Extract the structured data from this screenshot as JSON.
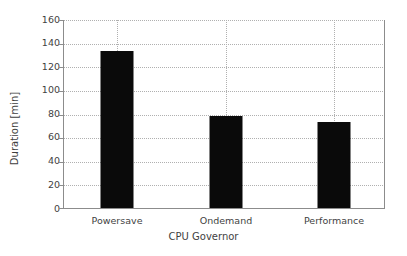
{
  "chart_data": {
    "type": "bar",
    "title": "",
    "subtitle": "",
    "categories": [
      "Powersave",
      "Ondemand",
      "Performance"
    ],
    "values": [
      134,
      78,
      73
    ],
    "series": [
      {
        "name": "Duration",
        "values": [
          134,
          78,
          73
        ]
      }
    ],
    "xlabel": "CPU Governor",
    "ylabel": "Duration [min]",
    "ylim": [
      0,
      160
    ],
    "yticks": [
      0,
      20,
      40,
      60,
      80,
      100,
      120,
      140,
      160
    ],
    "ytick_labels": [
      "0",
      "20",
      "40",
      "60",
      "80",
      "100",
      "120",
      "140",
      "160"
    ],
    "grid": true,
    "grid_style": "dotted",
    "legend": false,
    "legend_position": "none",
    "bar_color": "#0a0a0a",
    "grid_color": "#b0b0b0",
    "axis_color": "#8c8c8c",
    "text_color": "#3f3f3f",
    "background": "#ffffff"
  },
  "axes": {
    "y_title": "Duration [min]",
    "x_title": "CPU Governor"
  }
}
